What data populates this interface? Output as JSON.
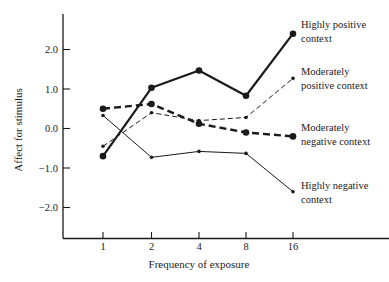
{
  "chart_data": {
    "type": "line",
    "title": "",
    "xlabel": "Frequency of exposure",
    "ylabel": "Affect for stimulus",
    "categories": [
      "1",
      "2",
      "4",
      "8",
      "16"
    ],
    "yticks": [
      "2.0",
      "1.0",
      "0.0",
      "-1.0",
      "-2.0"
    ],
    "ytick_values": [
      2.0,
      1.0,
      0.0,
      -1.0,
      -2.0
    ],
    "ylim": [
      -2.8,
      2.9
    ],
    "grid": false,
    "legend_position": "right, inline labels at line ends",
    "series": [
      {
        "name": "Highly positive context",
        "label_lines": [
          "Highly positive",
          "context"
        ],
        "style": "solid-thick",
        "marker": "large-dot",
        "values": [
          -0.7,
          1.03,
          1.47,
          0.83,
          2.4
        ]
      },
      {
        "name": "Moderately positive context",
        "label_lines": [
          "Moderately",
          "positive context"
        ],
        "style": "dashed-thin",
        "marker": "small-dot",
        "values": [
          -0.45,
          0.4,
          0.2,
          0.28,
          1.27
        ]
      },
      {
        "name": "Moderately negative context",
        "label_lines": [
          "Moderately",
          "negative context"
        ],
        "style": "dashed-thick",
        "marker": "large-dot",
        "values": [
          0.5,
          0.62,
          0.12,
          -0.1,
          -0.2
        ]
      },
      {
        "name": "Highly negative context",
        "label_lines": [
          "Highly negative",
          "context"
        ],
        "style": "solid-thin",
        "marker": "small-dot",
        "values": [
          0.33,
          -0.73,
          -0.58,
          -0.63,
          -1.6
        ]
      }
    ]
  },
  "colors": {
    "ink": "#1a1a1a",
    "background": "#ffffff"
  }
}
